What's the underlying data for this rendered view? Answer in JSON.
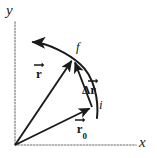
{
  "figure": {
    "background_color": "#ffffff",
    "ink_color": "#1a1a1a",
    "axis_color": "#9a9a9a"
  },
  "axes": {
    "y_label": "y",
    "x_label": "x",
    "style": "dotted",
    "origin": {
      "x": 15,
      "y": 145
    }
  },
  "points": [
    {
      "name": "initial",
      "label": "i",
      "x": 92,
      "y": 107
    },
    {
      "name": "final",
      "label": "f",
      "x": 73,
      "y": 58
    }
  ],
  "vectors": [
    {
      "name": "r-zero",
      "symbol": "r",
      "subscript": "0",
      "label_text": "r0",
      "description": "initial position vector from origin to i",
      "from": {
        "x": 15,
        "y": 145
      },
      "to": {
        "x": 92,
        "y": 107
      }
    },
    {
      "name": "r",
      "symbol": "r",
      "subscript": "",
      "label_text": "r",
      "description": "final position vector from origin to f",
      "from": {
        "x": 15,
        "y": 145
      },
      "to": {
        "x": 73,
        "y": 58
      }
    },
    {
      "name": "delta-r",
      "symbol": "r",
      "prefix": "Δ",
      "subscript": "",
      "label_text": "Δr",
      "description": "displacement vector from i to f",
      "from": {
        "x": 92,
        "y": 107
      },
      "to": {
        "x": 73,
        "y": 58
      }
    }
  ],
  "trajectory": {
    "name": "path-curve",
    "description": "curved particle path through i and f continuing up-left",
    "arrow_tip": {
      "x": 30,
      "y": 42
    }
  }
}
